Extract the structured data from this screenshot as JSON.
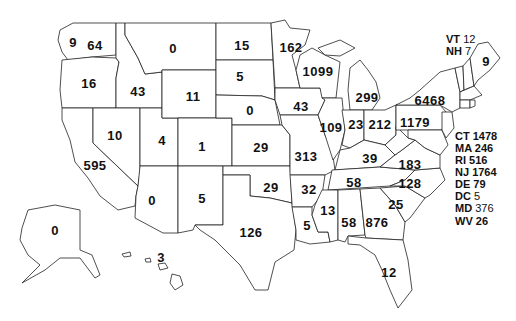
{
  "map": {
    "type": "choropleth-labels",
    "region": "United States",
    "states": [
      {
        "abbr": "WA",
        "value": "64",
        "x": 95,
        "y": 45
      },
      {
        "abbr": "WA-Puget",
        "value": "9",
        "x": 73,
        "y": 42
      },
      {
        "abbr": "OR",
        "value": "16",
        "x": 89,
        "y": 83
      },
      {
        "abbr": "ID",
        "value": "43",
        "x": 138,
        "y": 91
      },
      {
        "abbr": "MT",
        "value": "0",
        "x": 173,
        "y": 48
      },
      {
        "abbr": "WY",
        "value": "11",
        "x": 193,
        "y": 96
      },
      {
        "abbr": "ND",
        "value": "15",
        "x": 242,
        "y": 45
      },
      {
        "abbr": "SD",
        "value": "5",
        "x": 240,
        "y": 76
      },
      {
        "abbr": "NE",
        "value": "0",
        "x": 250,
        "y": 110
      },
      {
        "abbr": "MN",
        "value": "162",
        "x": 291,
        "y": 47
      },
      {
        "abbr": "WI",
        "value": "1099",
        "x": 318,
        "y": 71
      },
      {
        "abbr": "MI",
        "value": "299",
        "x": 367,
        "y": 97
      },
      {
        "abbr": "IA",
        "value": "43",
        "x": 301,
        "y": 106
      },
      {
        "abbr": "NV",
        "value": "10",
        "x": 115,
        "y": 135
      },
      {
        "abbr": "UT",
        "value": "4",
        "x": 162,
        "y": 140
      },
      {
        "abbr": "CO",
        "value": "1",
        "x": 202,
        "y": 146
      },
      {
        "abbr": "KS",
        "value": "29",
        "x": 261,
        "y": 147
      },
      {
        "abbr": "IL",
        "value": "109",
        "x": 331,
        "y": 127
      },
      {
        "abbr": "IN",
        "value": "23",
        "x": 356,
        "y": 124
      },
      {
        "abbr": "OH",
        "value": "212",
        "x": 380,
        "y": 124
      },
      {
        "abbr": "PA",
        "value": "1179",
        "x": 415,
        "y": 122
      },
      {
        "abbr": "NY",
        "value": "6468",
        "x": 430,
        "y": 100
      },
      {
        "abbr": "ME",
        "value": "9",
        "x": 486,
        "y": 61
      },
      {
        "abbr": "CA",
        "value": "595",
        "x": 95,
        "y": 165
      },
      {
        "abbr": "AZ",
        "value": "0",
        "x": 152,
        "y": 200
      },
      {
        "abbr": "NM",
        "value": "5",
        "x": 202,
        "y": 198
      },
      {
        "abbr": "MO",
        "value": "313",
        "x": 306,
        "y": 156
      },
      {
        "abbr": "KY",
        "value": "39",
        "x": 370,
        "y": 158
      },
      {
        "abbr": "VA",
        "value": "183",
        "x": 410,
        "y": 164
      },
      {
        "abbr": "OK",
        "value": "29",
        "x": 271,
        "y": 187
      },
      {
        "abbr": "AR",
        "value": "32",
        "x": 309,
        "y": 189
      },
      {
        "abbr": "TN",
        "value": "58",
        "x": 354,
        "y": 182
      },
      {
        "abbr": "NC",
        "value": "128",
        "x": 410,
        "y": 183
      },
      {
        "abbr": "SC",
        "value": "25",
        "x": 396,
        "y": 204
      },
      {
        "abbr": "TX",
        "value": "126",
        "x": 251,
        "y": 232
      },
      {
        "abbr": "MS",
        "value": "13",
        "x": 328,
        "y": 210
      },
      {
        "abbr": "AL",
        "value": "58",
        "x": 349,
        "y": 222
      },
      {
        "abbr": "GA",
        "value": "876",
        "x": 377,
        "y": 222
      },
      {
        "abbr": "LA",
        "value": "5",
        "x": 307,
        "y": 225
      },
      {
        "abbr": "FL",
        "value": "12",
        "x": 389,
        "y": 272
      },
      {
        "abbr": "AK",
        "value": "0",
        "x": 55,
        "y": 230
      },
      {
        "abbr": "HI",
        "value": "3",
        "x": 161,
        "y": 257
      }
    ],
    "legend_top": [
      {
        "abbr": "VT",
        "value": "12"
      },
      {
        "abbr": "NH",
        "value": "7"
      }
    ],
    "legend_side": [
      {
        "abbr": "CT",
        "value": "1478"
      },
      {
        "abbr": "MA",
        "value": "246"
      },
      {
        "abbr": "RI",
        "value": "516"
      },
      {
        "abbr": "NJ",
        "value": "1764"
      },
      {
        "abbr": "DE",
        "value": "79"
      },
      {
        "abbr": "DC",
        "value": "5"
      },
      {
        "abbr": "MD",
        "value": "376"
      },
      {
        "abbr": "WV",
        "value": "26"
      }
    ]
  },
  "colors": {
    "outline": "#222222",
    "fill": "#ffffff",
    "text": "#111111"
  }
}
